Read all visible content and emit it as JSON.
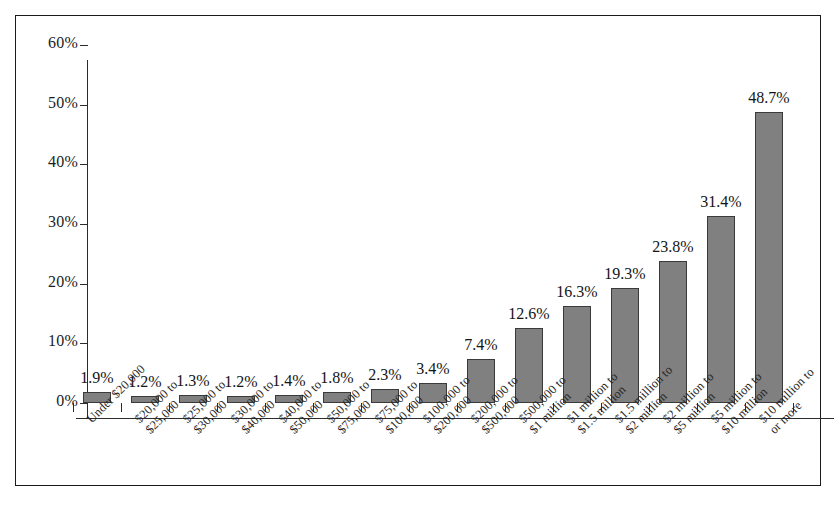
{
  "chart_data": {
    "type": "bar",
    "title": "",
    "subtitle": "",
    "xlabel": "",
    "ylabel": "",
    "ylim": [
      0,
      60
    ],
    "ytick_values": [
      0,
      10,
      20,
      30,
      40,
      50,
      60
    ],
    "ytick_labels": [
      "0%",
      "10%",
      "20%",
      "30%",
      "40%",
      "50%",
      "60%"
    ],
    "grid": false,
    "legend": null,
    "bar_color": "#808080",
    "bar_edge_color": "#3a3a3a",
    "categories": [
      "Under $20,000",
      "$20,000 to $25,000",
      "$25,000 to $30,000",
      "$30,000 to $40,000",
      "$40,000 to $50,000",
      "$50,000 to $75,000",
      "$75,000 to $100,000",
      "$100,000 to $200,000",
      "$200,000 to $500,000",
      "$500,000 to $1 million",
      "$1 million to $1.5 million",
      "$1.5 million to $2 million",
      "$2 million to $5 million",
      "$5 million to $10 million",
      "$10 million to or more"
    ],
    "category_lines": [
      [
        "Under $20,000"
      ],
      [
        "$20,000 to",
        "$25,000"
      ],
      [
        "$25,000 to",
        "$30,000"
      ],
      [
        "$30,000 to",
        "$40,000"
      ],
      [
        "$40,000 to",
        "$50,000"
      ],
      [
        "$50,000 to",
        "$75,000"
      ],
      [
        "$75,000 to",
        "$100,000"
      ],
      [
        "$100,000 to",
        "$200,000"
      ],
      [
        "$200,000 to",
        "$500,000"
      ],
      [
        "$500,000 to",
        "$1 million"
      ],
      [
        "$1 million to",
        "$1.5 million"
      ],
      [
        "$1.5 million to",
        "$2 million"
      ],
      [
        "$2 million to",
        "$5 million"
      ],
      [
        "$5 million to",
        "$10 million"
      ],
      [
        "$10 million to",
        "or more"
      ]
    ],
    "values": [
      1.9,
      1.2,
      1.3,
      1.2,
      1.4,
      1.8,
      2.3,
      3.4,
      7.4,
      12.6,
      16.3,
      19.3,
      23.8,
      31.4,
      48.7
    ],
    "value_labels": [
      "1.9%",
      "1.2%",
      "1.3%",
      "1.2%",
      "1.4%",
      "1.8%",
      "2.3%",
      "3.4%",
      "7.4%",
      "12.6%",
      "16.3%",
      "19.3%",
      "23.8%",
      "31.4%",
      "48.7%"
    ]
  }
}
